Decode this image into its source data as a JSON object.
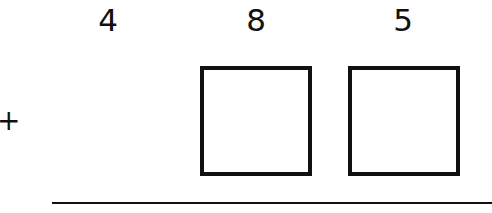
{
  "problem": {
    "top_digits": [
      "4",
      "8",
      "5"
    ],
    "operator": "+",
    "blank_boxes": 2,
    "colors": {
      "ink": "#111111",
      "background": "#ffffff"
    }
  }
}
